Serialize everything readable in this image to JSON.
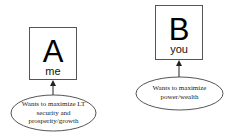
{
  "diagram": {
    "nodes": [
      {
        "id": "A",
        "letter": "A",
        "label": "me",
        "goal": "Wants to maximize LT security and prosperity/growth",
        "goal_lines": [
          "Wants to maximize LT",
          "security and",
          "prosperity/growth"
        ]
      },
      {
        "id": "B",
        "letter": "B",
        "label": "you",
        "goal": "Wants to maximize power/wealth",
        "goal_lines": [
          "Wants to maximize",
          "power/wealth"
        ]
      }
    ],
    "edges": [
      {
        "from": "goal-A",
        "to": "A",
        "style": "arrow"
      },
      {
        "from": "goal-B",
        "to": "B",
        "style": "arrow"
      }
    ],
    "colors": {
      "stroke": "#555555",
      "text": "#000000",
      "background": "#ffffff"
    }
  }
}
